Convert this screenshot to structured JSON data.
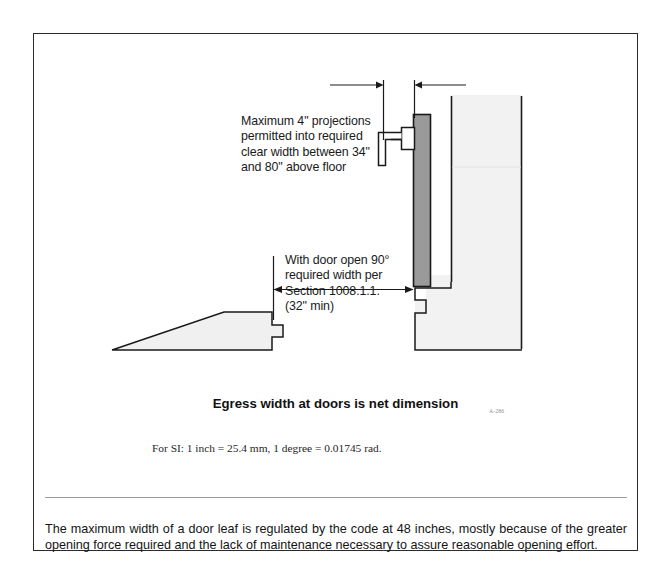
{
  "document": {
    "figure": {
      "annotations": {
        "projection_note": "Maximum 4\" projections\npermitted into required\nclear width between 34\"\nand 80\" above floor",
        "clear_width_note": "With door open 90°\nrequired width per\nSection 1008.1.1.\n(32\" min)"
      },
      "caption": "Egress width at doors  is net dimension",
      "figure_code": "A-286",
      "si_note": "For SI: 1 inch = 25.4 mm, 1 degree = 0.01745 rad.",
      "elements": {
        "door_label": "door-leaf",
        "handle_label": "lever-handle",
        "wall_right_label": "right-wall-section",
        "wall_left_label": "left-wall-section",
        "dim_projection_label": "projection-dimension",
        "dim_clearwidth_label": "clear-width-dimension"
      }
    },
    "body_paragraph": "The maximum width of a door leaf is regulated by the code at 48 inches, mostly because of the greater opening force required and the lack of maintenance necessary to assure reasonable opening effort."
  },
  "colors": {
    "border": "#2b2b2b",
    "door_fill": "#9a9a9a",
    "wall_fill": "#f2f2f2",
    "line": "#1a1a1a",
    "rule": "#9a9a9a",
    "text": "#141414"
  }
}
